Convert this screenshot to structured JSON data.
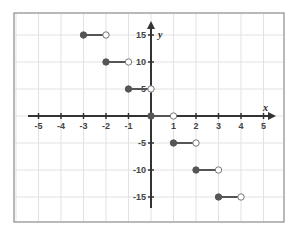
{
  "chart_data": {
    "type": "line",
    "subtype": "step-function",
    "title": "",
    "xlabel": "x",
    "ylabel": "y",
    "xlim": [
      -5,
      5
    ],
    "ylim": [
      -15,
      15
    ],
    "x_ticks": [
      -5,
      -4,
      -3,
      -2,
      -1,
      1,
      2,
      3,
      4,
      5
    ],
    "x_tick_labels": [
      "-5",
      "-4",
      "-3",
      "-2",
      "-1",
      "1",
      "2",
      "3",
      "4",
      "5"
    ],
    "y_ticks": [
      15,
      10,
      5,
      -5,
      -10,
      -15
    ],
    "y_tick_labels": [
      "15",
      "10",
      "5",
      "-5",
      "-10",
      "-15"
    ],
    "grid": true,
    "legend": null,
    "segments": [
      {
        "x_start": -3,
        "x_end": -2,
        "y": 15,
        "start_closed": true,
        "end_closed": false
      },
      {
        "x_start": -2,
        "x_end": -1,
        "y": 10,
        "start_closed": true,
        "end_closed": false
      },
      {
        "x_start": -1,
        "x_end": 0,
        "y": 5,
        "start_closed": true,
        "end_closed": false
      },
      {
        "x_start": 0,
        "x_end": 1,
        "y": 0,
        "start_closed": true,
        "end_closed": false
      },
      {
        "x_start": 1,
        "x_end": 2,
        "y": -5,
        "start_closed": true,
        "end_closed": false
      },
      {
        "x_start": 2,
        "x_end": 3,
        "y": -10,
        "start_closed": true,
        "end_closed": false
      },
      {
        "x_start": 3,
        "x_end": 4,
        "y": -15,
        "start_closed": true,
        "end_closed": false
      }
    ]
  },
  "colors": {
    "grid": "#e2e2e2",
    "border": "#8a8a8a",
    "axis": "#333333",
    "series": "#555555",
    "open_fill": "#ffffff"
  }
}
